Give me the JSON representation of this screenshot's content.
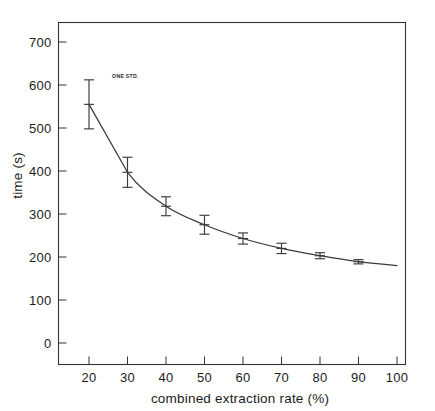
{
  "chart_data": {
    "type": "line",
    "title": "",
    "xlabel": "combined extraction rate (%)",
    "ylabel": "time (s)",
    "xlim": [
      15,
      105
    ],
    "ylim": [
      -50,
      730
    ],
    "grid": false,
    "legend": "none",
    "annotations": [
      {
        "text": "ONE STD.",
        "x": 26,
        "y": 617
      }
    ],
    "x": [
      20,
      30,
      40,
      50,
      60,
      70,
      80,
      90
    ],
    "values": [
      555,
      397,
      318,
      275,
      243,
      220,
      203,
      189
    ],
    "yerr": [
      57,
      35,
      22,
      22,
      13,
      12,
      7,
      5
    ],
    "curve_end": {
      "x": 100,
      "y": 180
    },
    "xticks": [
      20,
      30,
      40,
      50,
      60,
      70,
      80,
      90,
      100
    ],
    "xtick_labels": [
      "20",
      "30",
      "40",
      "50",
      "60",
      "70",
      "80",
      "90",
      "100"
    ],
    "yticks": [
      0,
      100,
      200,
      300,
      400,
      500,
      600,
      700
    ],
    "ytick_labels": [
      "0",
      "100",
      "200",
      "300",
      "400",
      "500",
      "600",
      "700"
    ],
    "series_name": "time vs combined extraction rate",
    "marker": "error-bar-cap",
    "colors": {
      "background": "#ffffff",
      "axis": "#333333",
      "curve": "#3a3a3a",
      "text": "#1c1c1c"
    }
  }
}
